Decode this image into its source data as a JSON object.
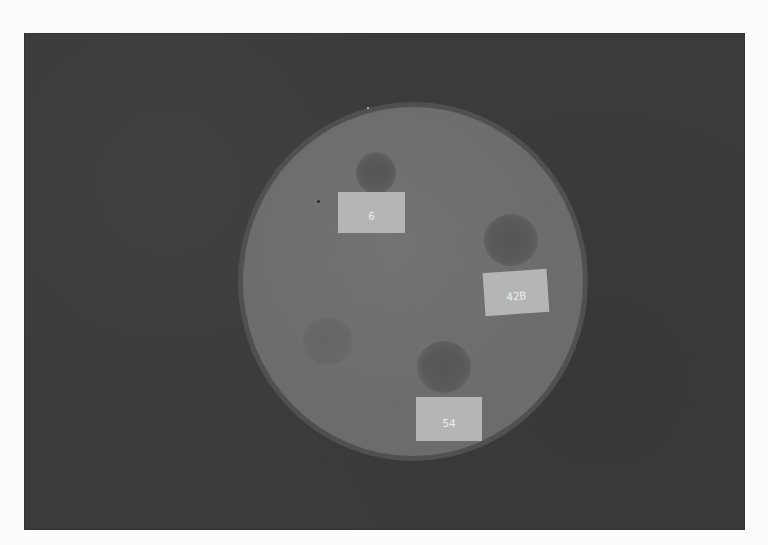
{
  "image": {
    "description": "Petri dish on dark background with three paper labels and darker inhibition/colony spots",
    "colors": {
      "page_background": "#fbfbfb",
      "backdrop": "#3b3b3b",
      "plate": "#6c6c6c",
      "plate_rim": "#505050",
      "label_paper": "#b5b5b5",
      "label_text": "#ededed",
      "spot": "#545454"
    }
  },
  "plate": {
    "labels": [
      {
        "id": "label-6",
        "text": "6"
      },
      {
        "id": "label-42b",
        "text": "42B"
      },
      {
        "id": "label-54",
        "text": "54"
      }
    ]
  }
}
